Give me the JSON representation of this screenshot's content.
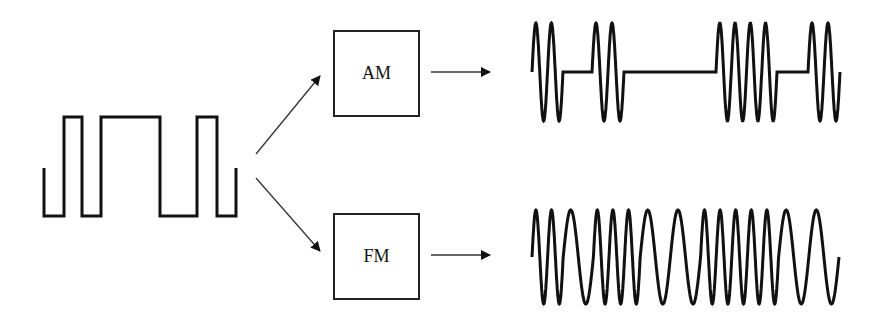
{
  "diagram": {
    "input_signal": {
      "label": "digital-square-wave",
      "bits": [
        0,
        1,
        0,
        1,
        1,
        1,
        0,
        0,
        1,
        0
      ]
    },
    "modulators": [
      {
        "label": "AM"
      },
      {
        "label": "FM"
      }
    ],
    "outputs": [
      {
        "label": "amplitude-modulated-wave"
      },
      {
        "label": "frequency-modulated-wave"
      }
    ],
    "colors": {
      "stroke": "#111111",
      "background": "#ffffff"
    }
  }
}
